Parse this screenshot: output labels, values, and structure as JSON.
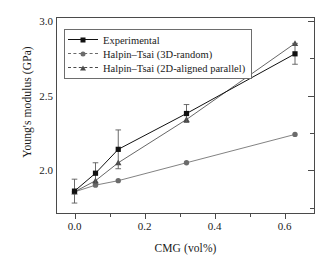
{
  "chart_data": {
    "type": "line",
    "title": "",
    "xlabel": "CMG (vol%)",
    "ylabel": "Young's modulus (GPa)",
    "xlim": [
      -0.05,
      0.69
    ],
    "ylim": [
      1.7,
      3.02
    ],
    "xticks": [
      "0.0",
      "0.2",
      "0.4",
      "0.6"
    ],
    "xtick_values": [
      0.0,
      0.2,
      0.4,
      0.6
    ],
    "xtick_minor_values": [
      0.1,
      0.3,
      0.5
    ],
    "yticks": [
      "2.0",
      "2.5",
      "3.0"
    ],
    "ytick_values": [
      2.0,
      2.5,
      3.0
    ],
    "ytick_minor_values": [
      1.75,
      2.25,
      2.75
    ],
    "grid": false,
    "legend_position": "upper left",
    "x": [
      0.0,
      0.06,
      0.125,
      0.32,
      0.63
    ],
    "series": [
      {
        "name": "Experimental",
        "marker": "square",
        "color": "#111111",
        "linestyle": "solid",
        "values": [
          1.86,
          1.98,
          2.14,
          2.38,
          2.78
        ],
        "yerr": [
          0.08,
          0.07,
          0.13,
          0.06,
          0.07
        ]
      },
      {
        "name": "Halpin–Tsai (3D-random)",
        "marker": "circle",
        "color": "#6b6b6b",
        "linestyle": "solid",
        "values": [
          1.855,
          1.9,
          1.93,
          2.05,
          2.24
        ],
        "yerr": [
          0,
          0,
          0,
          0,
          0
        ]
      },
      {
        "name": "Halpin–Tsai (2D-aligned parallel)",
        "marker": "triangle",
        "color": "#4a4a4a",
        "linestyle": "solid",
        "values": [
          1.855,
          1.93,
          2.05,
          2.34,
          2.85
        ],
        "yerr": [
          0,
          0,
          0,
          0,
          0
        ]
      }
    ]
  },
  "legend": {
    "items": [
      {
        "label": "Experimental"
      },
      {
        "label": "Halpin–Tsai (3D-random)"
      },
      {
        "label": "Halpin–Tsai (2D-aligned parallel)"
      }
    ]
  },
  "colors": {
    "experimental": "#111111",
    "halpin_3d_random": "#6b6b6b",
    "halpin_2d_aligned": "#4a4a4a",
    "axis": "#4a4a4a",
    "background": "#ffffff"
  }
}
